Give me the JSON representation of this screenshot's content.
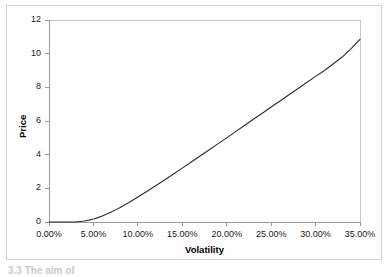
{
  "figure": {
    "background_color": "#ffffff",
    "border_color": "#d4d4d4",
    "footer_fragment": "3.3  The aim of"
  },
  "chart_data": {
    "type": "line",
    "title": "",
    "subtitle": "",
    "xlabel": "Volatility",
    "ylabel": "Price",
    "grid": false,
    "legend": false,
    "legend_position": "none",
    "line_color": "#2b2b2b",
    "xlim": [
      0,
      35
    ],
    "ylim": [
      0,
      12
    ],
    "x_tick_labels": [
      "0.00%",
      "5.00%",
      "10.00%",
      "15.00%",
      "20.00%",
      "25.00%",
      "30.00%",
      "35.00%"
    ],
    "x_ticks": [
      0,
      5,
      10,
      15,
      20,
      25,
      30,
      35
    ],
    "y_tick_labels": [
      "0",
      "2",
      "4",
      "6",
      "8",
      "10",
      "12"
    ],
    "y_ticks": [
      0,
      2,
      4,
      6,
      8,
      10,
      12
    ],
    "x_unit": "percent",
    "series": [
      {
        "name": "Price",
        "x": [
          0,
          1,
          2,
          3,
          3.5,
          4,
          4.5,
          5,
          5.5,
          6,
          6.5,
          7,
          7.5,
          8,
          9,
          10,
          11,
          12,
          13,
          14,
          15,
          16,
          17,
          18,
          19,
          20,
          21,
          22,
          23,
          24,
          25,
          26,
          27,
          28,
          29,
          30,
          31,
          32,
          33,
          34,
          35
        ],
        "y": [
          0,
          0,
          0,
          0.01,
          0.03,
          0.06,
          0.11,
          0.18,
          0.26,
          0.36,
          0.47,
          0.59,
          0.72,
          0.86,
          1.16,
          1.48,
          1.81,
          2.15,
          2.5,
          2.85,
          3.2,
          3.56,
          3.92,
          4.28,
          4.64,
          5.0,
          5.37,
          5.73,
          6.1,
          6.46,
          6.83,
          7.19,
          7.56,
          7.92,
          8.29,
          8.65,
          9.0,
          9.4,
          9.8,
          10.3,
          10.85
        ]
      }
    ]
  }
}
